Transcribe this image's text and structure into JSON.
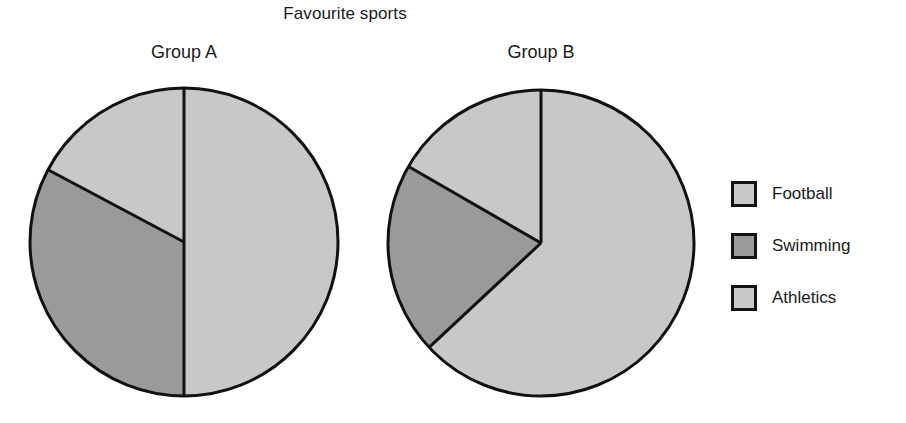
{
  "chart_data": {
    "type": "pie",
    "title": "Favourite sports",
    "xlabel": "",
    "ylabel": "",
    "legend_position": "right",
    "grid": false,
    "categories": [
      "Football",
      "Swimming",
      "Athletics"
    ],
    "colors": {
      "Football": "#c8c8c8",
      "Swimming": "#9a9a9a",
      "Athletics": "#c8c8c8",
      "outline": "#111111",
      "background": "#ffffff"
    },
    "charts": [
      {
        "name": "Group A",
        "label": "Group A",
        "center": [
          184,
          242
        ],
        "radius": 154,
        "slices": [
          {
            "label": "Football",
            "value": 50,
            "start_deg": 0,
            "end_deg": 180,
            "color": "#c8c8c8"
          },
          {
            "label": "Swimming",
            "value": 33,
            "start_deg": 180,
            "end_deg": 298,
            "color": "#9a9a9a"
          },
          {
            "label": "Athletics",
            "value": 17,
            "start_deg": 298,
            "end_deg": 360,
            "color": "#c8c8c8"
          }
        ]
      },
      {
        "name": "Group B",
        "label": "Group B",
        "center": [
          541,
          243
        ],
        "radius": 153,
        "slices": [
          {
            "label": "Football",
            "value": 63,
            "start_deg": 0,
            "end_deg": 227,
            "color": "#c8c8c8"
          },
          {
            "label": "Swimming",
            "value": 20,
            "start_deg": 227,
            "end_deg": 300,
            "color": "#9a9a9a"
          },
          {
            "label": "Athletics",
            "value": 17,
            "start_deg": 300,
            "end_deg": 360,
            "color": "#c8c8c8"
          }
        ]
      }
    ]
  },
  "title": "Favourite sports",
  "pies": [
    {
      "label": "Group A"
    },
    {
      "label": "Group B"
    }
  ],
  "legend": {
    "items": [
      {
        "label": "Football",
        "color": "#c8c8c8"
      },
      {
        "label": "Swimming",
        "color": "#9a9a9a"
      },
      {
        "label": "Athletics",
        "color": "#c8c8c8"
      }
    ]
  }
}
